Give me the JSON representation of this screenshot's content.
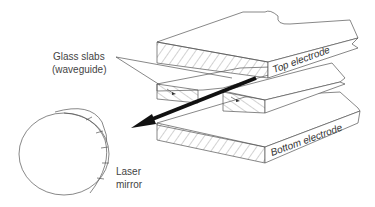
{
  "diagram": {
    "type": "technical-illustration",
    "labels": {
      "glass_slabs": "Glass slabs",
      "waveguide": "(waveguide)",
      "top_electrode": "Top electrode",
      "bottom_electrode": "Bottom electrode",
      "laser": "Laser",
      "mirror": "mirror"
    },
    "components": [
      {
        "name": "top-electrode",
        "label": "Top electrode",
        "style": "hatched slab"
      },
      {
        "name": "glass-slab-left",
        "label": "Glass slabs (waveguide)",
        "style": "hatched slab"
      },
      {
        "name": "glass-slab-right",
        "label": "Glass slabs (waveguide)",
        "style": "hatched slab"
      },
      {
        "name": "bottom-electrode",
        "label": "Bottom electrode",
        "style": "hatched slab"
      },
      {
        "name": "laser-mirror",
        "label": "Laser mirror",
        "style": "disc"
      },
      {
        "name": "laser-beam-arrow",
        "label": "",
        "style": "thick black arrow"
      }
    ],
    "colors": {
      "line": "#555555",
      "beam": "#111111",
      "background": "#ffffff"
    }
  }
}
